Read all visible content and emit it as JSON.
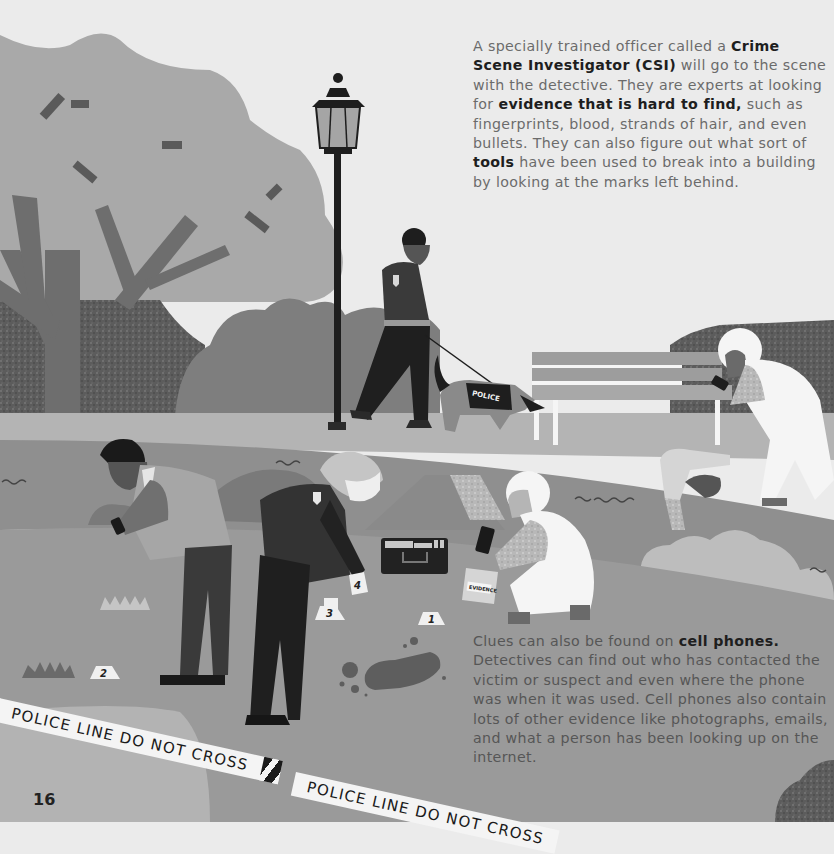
{
  "page": {
    "number": "16",
    "style": "grayscale children's book illustration"
  },
  "top_paragraph": {
    "segments": [
      {
        "text": "A specially trained officer called a ",
        "bold": false
      },
      {
        "text": "Crime Scene Investigator (CSI)",
        "bold": true
      },
      {
        "text": " will go to the scene with the detective. They are experts at looking for ",
        "bold": false
      },
      {
        "text": "evidence that is hard to find,",
        "bold": true
      },
      {
        "text": " such as fingerprints, blood, strands of hair, and even bullets. They can also figure out what sort of ",
        "bold": false
      },
      {
        "text": "tools",
        "bold": true
      },
      {
        "text": " have been used to break into a building by looking at the marks left behind.",
        "bold": false
      }
    ]
  },
  "bottom_paragraph": {
    "segments": [
      {
        "text": "Clues can also be found on ",
        "bold": false
      },
      {
        "text": "cell phones.",
        "bold": true
      },
      {
        "text": " Detectives can find out who has contacted the victim or suspect and even where the phone was when it was used. Cell phones also contain lots of other evidence like photographs, emails, and what a person has been looking up on the internet.",
        "bold": false
      }
    ]
  },
  "illustration": {
    "police_tape": [
      {
        "text": "POLICE LINE DO NOT CROSS"
      },
      {
        "text": "POLICE LINE DO NOT CROSS"
      }
    ],
    "dog_vest_label": "POLICE",
    "evidence_bag_label": "EVIDENCE",
    "evidence_markers": [
      "1",
      "2",
      "3",
      "4"
    ],
    "elements": [
      "tree",
      "street-lamp",
      "park-bench",
      "officer-with-dog",
      "detective-with-phone",
      "police-officer",
      "csi-kneeling",
      "csi-at-bench",
      "evidence-case",
      "footprint",
      "body-outline"
    ]
  },
  "colors": {
    "sky": "#ebebeb",
    "tree_canopy": "#a9a9a9",
    "ground": "#9a9a9a",
    "dark": "#2a2a2a",
    "text_body": "#6b6b6b",
    "text_bold": "#1e1e1e"
  }
}
